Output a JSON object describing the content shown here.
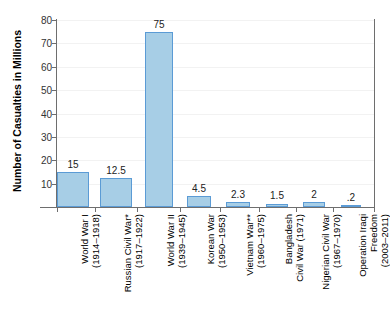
{
  "chart_data": {
    "type": "bar",
    "title": "",
    "xlabel": "",
    "ylabel": "Number of Casualties in Millions",
    "ylim": [
      0,
      80
    ],
    "ytick_labels": [
      "80",
      "70",
      "60",
      "50",
      "40",
      "30",
      "20",
      "10"
    ],
    "ytick_values": [
      80,
      70,
      60,
      50,
      40,
      30,
      20,
      10
    ],
    "grid": true,
    "legend": "none",
    "categories": [
      "World War I (1914–1918)",
      "Russian Civil War* (1917–1922)",
      "World War II (1939–1945)",
      "Korean War (1950–1953)",
      "Vietnam War** (1960–1975)",
      "Bangladesh Civil War (1971)",
      "Nigerian Civil War (1967–1970)",
      "Operation Iraqi Freedom (2003–2011)"
    ],
    "values": [
      15,
      12.5,
      75,
      4.5,
      2.3,
      1.5,
      2,
      0.2
    ],
    "value_labels": [
      "15",
      "12.5",
      "75",
      "4.5",
      "2.3",
      "1.5",
      "2",
      ".2"
    ],
    "bars": [
      {
        "name": "World War I",
        "line1": "World War I",
        "line2": "(1914–1918)",
        "value": 15,
        "value_label": "15"
      },
      {
        "name": "Russian Civil War*",
        "line1": "Russian Civil War*",
        "line2": "(1917–1922)",
        "value": 12.5,
        "value_label": "12.5"
      },
      {
        "name": "World War II",
        "line1": "World War II",
        "line2": "(1939–1945)",
        "value": 75,
        "value_label": "75"
      },
      {
        "name": "Korean War",
        "line1": "Korean War",
        "line2": "(1950–1953)",
        "value": 4.5,
        "value_label": "4.5"
      },
      {
        "name": "Vietnam War**",
        "line1": "Vietnam War**",
        "line2": "(1960–1975)",
        "value": 2.3,
        "value_label": "2.3"
      },
      {
        "name": "Bangladesh Civil War",
        "line1": "Bangladesh",
        "line2": "Civil War (1971)",
        "value": 1.5,
        "value_label": "1.5"
      },
      {
        "name": "Nigerian Civil War",
        "line1": "Nigerian Civil War",
        "line2": "(1967–1970)",
        "value": 2,
        "value_label": "2"
      },
      {
        "name": "Operation Iraqi Freedom",
        "line1": "Operation Iraqi",
        "line2": "Freedom",
        "line3": "(2003–2011)",
        "value": 0.2,
        "value_label": ".2"
      }
    ],
    "colors": {
      "bar_fill": "#a7cee6",
      "bar_border": "#5b9bd5",
      "axis": "#6e6e6e",
      "gridline": "#f2f2f2",
      "text": "#000000",
      "background": "#ffffff"
    }
  },
  "layout": {
    "bar_geometry": [
      {
        "center": 73,
        "width": 32
      },
      {
        "center": 116,
        "width": 32
      },
      {
        "center": 159,
        "width": 28
      },
      {
        "center": 199,
        "width": 24
      },
      {
        "center": 238,
        "width": 24
      },
      {
        "center": 277,
        "width": 22
      },
      {
        "center": 314,
        "width": 22
      },
      {
        "center": 351,
        "width": 20
      }
    ],
    "x_tick_positions": [
      57,
      95,
      137,
      180,
      220,
      259,
      296,
      333,
      374
    ],
    "plot": {
      "left": 57,
      "top": 20,
      "width": 318,
      "height": 187,
      "baseline": 207
    }
  }
}
